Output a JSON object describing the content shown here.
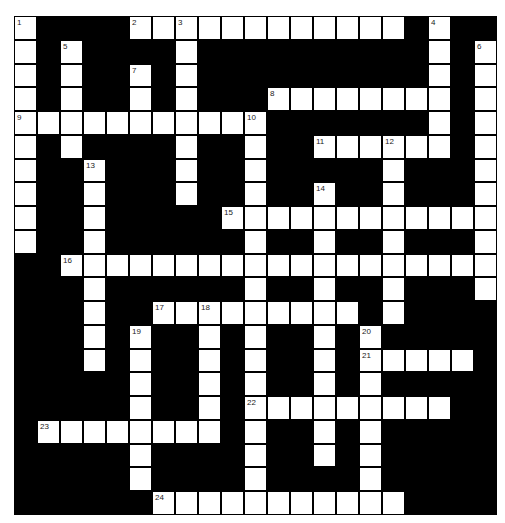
{
  "puzzle": {
    "type": "crossword",
    "rows": 21,
    "cols": 21,
    "cell_width": 23,
    "cell_height": 23.76,
    "colors": {
      "block": "#000000",
      "cell": "#ffffff",
      "number": "#222222"
    },
    "white_cells": {
      "0": [
        0,
        5,
        6,
        7,
        8,
        9,
        10,
        11,
        12,
        13,
        14,
        15,
        16,
        18
      ],
      "1": [
        0,
        2,
        7,
        18,
        20
      ],
      "2": [
        0,
        2,
        5,
        7,
        18,
        20
      ],
      "3": [
        0,
        2,
        5,
        7,
        11,
        12,
        13,
        14,
        15,
        16,
        17,
        18,
        20
      ],
      "4": [
        0,
        1,
        2,
        3,
        4,
        5,
        6,
        7,
        8,
        9,
        10,
        18,
        20
      ],
      "5": [
        0,
        2,
        7,
        10,
        13,
        14,
        15,
        16,
        17,
        18,
        20
      ],
      "6": [
        0,
        3,
        7,
        10,
        16,
        20
      ],
      "7": [
        0,
        3,
        7,
        10,
        13,
        16,
        20
      ],
      "8": [
        0,
        3,
        9,
        10,
        11,
        12,
        13,
        14,
        15,
        16,
        17,
        18,
        19,
        20
      ],
      "9": [
        0,
        3,
        10,
        13,
        16,
        20
      ],
      "10": [
        2,
        3,
        4,
        5,
        6,
        7,
        8,
        9,
        10,
        11,
        12,
        13,
        14,
        15,
        16,
        17,
        18,
        19,
        20
      ],
      "11": [
        3,
        10,
        13,
        16,
        20
      ],
      "12": [
        3,
        6,
        7,
        8,
        9,
        10,
        11,
        12,
        13,
        14,
        16
      ],
      "13": [
        3,
        5,
        8,
        10,
        13,
        15
      ],
      "14": [
        3,
        5,
        8,
        10,
        13,
        15,
        16,
        17,
        18,
        19
      ],
      "15": [
        5,
        8,
        10,
        13,
        15
      ],
      "16": [
        5,
        8,
        10,
        11,
        12,
        13,
        14,
        15,
        16,
        17,
        18
      ],
      "17": [
        1,
        2,
        3,
        4,
        5,
        6,
        7,
        8,
        10,
        13,
        15
      ],
      "18": [
        5,
        10,
        13,
        15
      ],
      "19": [
        5,
        10,
        15
      ],
      "20": [
        6,
        7,
        8,
        9,
        10,
        11,
        12,
        13,
        14,
        15,
        16
      ]
    },
    "numbers": [
      {
        "n": "1",
        "r": 0,
        "c": 0
      },
      {
        "n": "2",
        "r": 0,
        "c": 5
      },
      {
        "n": "3",
        "r": 0,
        "c": 7
      },
      {
        "n": "4",
        "r": 0,
        "c": 18
      },
      {
        "n": "5",
        "r": 1,
        "c": 2
      },
      {
        "n": "6",
        "r": 1,
        "c": 20
      },
      {
        "n": "7",
        "r": 2,
        "c": 5
      },
      {
        "n": "8",
        "r": 3,
        "c": 11
      },
      {
        "n": "9",
        "r": 4,
        "c": 0
      },
      {
        "n": "10",
        "r": 4,
        "c": 10
      },
      {
        "n": "11",
        "r": 5,
        "c": 13
      },
      {
        "n": "12",
        "r": 5,
        "c": 16
      },
      {
        "n": "13",
        "r": 6,
        "c": 3
      },
      {
        "n": "14",
        "r": 7,
        "c": 13
      },
      {
        "n": "15",
        "r": 8,
        "c": 9
      },
      {
        "n": "16",
        "r": 10,
        "c": 2
      },
      {
        "n": "17",
        "r": 12,
        "c": 6
      },
      {
        "n": "18",
        "r": 12,
        "c": 8
      },
      {
        "n": "19",
        "r": 13,
        "c": 5
      },
      {
        "n": "20",
        "r": 13,
        "c": 15
      },
      {
        "n": "21",
        "r": 14,
        "c": 15
      },
      {
        "n": "22",
        "r": 16,
        "c": 10
      },
      {
        "n": "23",
        "r": 17,
        "c": 1
      },
      {
        "n": "24",
        "r": 20,
        "c": 6
      }
    ]
  }
}
